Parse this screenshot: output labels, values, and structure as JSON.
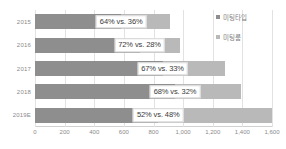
{
  "chart_data": {
    "type": "bar",
    "orientation": "horizontal",
    "stacked": true,
    "title": "",
    "xlabel": "",
    "ylabel": "",
    "xlim": [
      0,
      1600
    ],
    "grid": true,
    "legend_position": "top-right",
    "categories": [
      "2015",
      "2016",
      "2017",
      "2018",
      "2019E"
    ],
    "xticks": [
      "0",
      "200",
      "400",
      "600",
      "800",
      "1,000",
      "1,200",
      "1,400",
      "1,600"
    ],
    "xtick_values": [
      0,
      200,
      400,
      600,
      800,
      1000,
      1200,
      1400,
      1600
    ],
    "series": [
      {
        "name": "미팅타입",
        "color": "#8e8e8e",
        "values": [
          582,
          706,
          861,
          945,
          832
        ],
        "percent": [
          64,
          72,
          67,
          68,
          52
        ]
      },
      {
        "name": "미팅룸",
        "color": "#b9b9b9",
        "values": [
          328,
          274,
          424,
          445,
          768
        ],
        "percent": [
          36,
          28,
          33,
          32,
          48
        ]
      }
    ],
    "totals": [
      910,
      980,
      1285,
      1390,
      1600
    ],
    "data_labels": [
      "64% vs. 36%",
      "72% vs. 28%",
      "67% vs. 33%",
      "68% vs. 32%",
      "52% vs. 48%"
    ]
  }
}
